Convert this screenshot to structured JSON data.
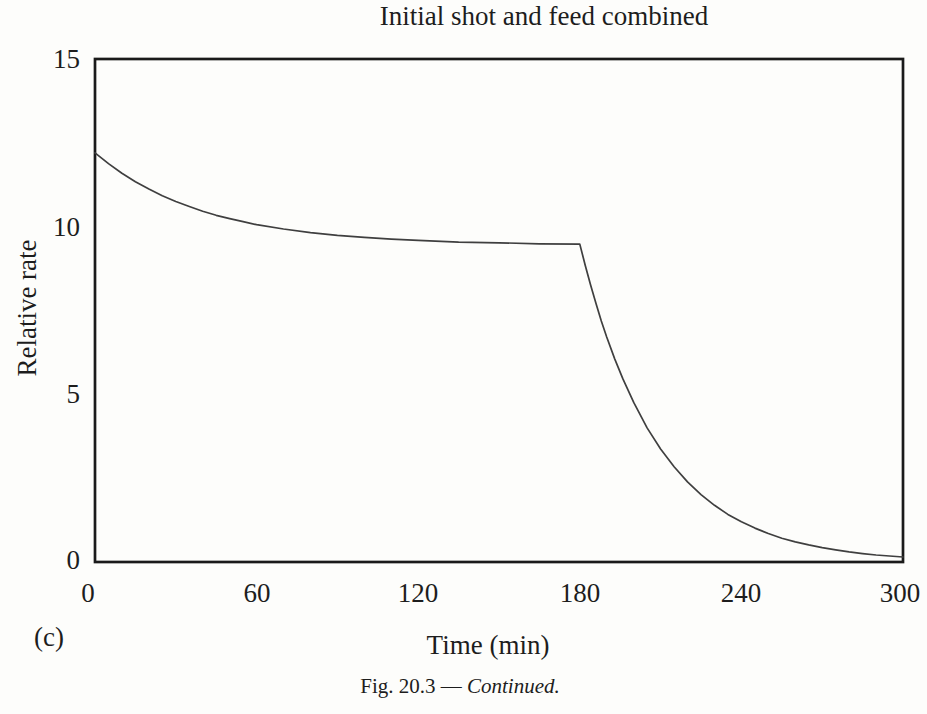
{
  "figure": {
    "title": "Initial shot and feed combined",
    "panel_label": "(c)",
    "xlabel": "Time (min)",
    "ylabel": "Relative rate",
    "caption_prefix": "Fig. 20.3 — ",
    "caption_italic": "Continued."
  },
  "colors": {
    "ink": "#1d1d1d",
    "frame": "#1a1a1a",
    "curve": "#3f3f3f",
    "background": "#fdfdfb"
  },
  "chart_data": {
    "type": "line",
    "title": "Initial shot and feed combined",
    "xlabel": "Time (min)",
    "ylabel": "Relative rate",
    "xlim": [
      0,
      300
    ],
    "ylim": [
      0,
      15
    ],
    "x_ticks": [
      0,
      60,
      120,
      180,
      240,
      300
    ],
    "y_ticks": [
      0,
      5,
      10,
      15
    ],
    "grid": false,
    "legend": "none",
    "series": [
      {
        "name": "relative-rate",
        "x": [
          0,
          5,
          10,
          15,
          20,
          25,
          30,
          35,
          40,
          45,
          50,
          55,
          60,
          70,
          80,
          90,
          100,
          110,
          120,
          135,
          150,
          165,
          180,
          182,
          184,
          186,
          188,
          190,
          193,
          196,
          200,
          205,
          210,
          215,
          220,
          225,
          230,
          235,
          240,
          245,
          250,
          255,
          260,
          265,
          270,
          275,
          280,
          285,
          290,
          295,
          300
        ],
        "y": [
          12.2,
          11.88,
          11.59,
          11.34,
          11.12,
          10.92,
          10.75,
          10.6,
          10.46,
          10.34,
          10.24,
          10.15,
          10.06,
          9.93,
          9.82,
          9.74,
          9.68,
          9.63,
          9.59,
          9.54,
          9.52,
          9.49,
          9.48,
          8.85,
          8.26,
          7.71,
          7.19,
          6.71,
          6.05,
          5.46,
          4.76,
          4.0,
          3.37,
          2.84,
          2.39,
          2.01,
          1.69,
          1.42,
          1.2,
          1.01,
          0.85,
          0.71,
          0.6,
          0.51,
          0.43,
          0.36,
          0.3,
          0.25,
          0.21,
          0.18,
          0.15
        ]
      }
    ]
  }
}
